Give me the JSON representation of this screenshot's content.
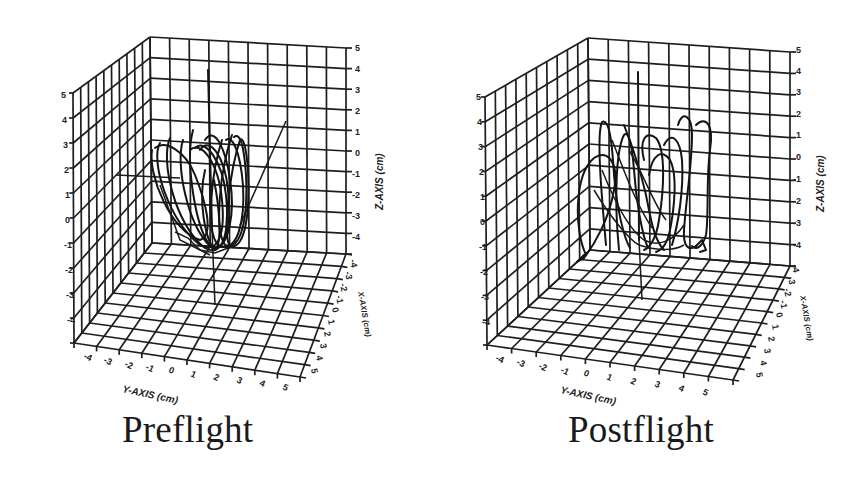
{
  "figure": {
    "panels": [
      {
        "id": "preflight",
        "caption": "Preflight"
      },
      {
        "id": "postflight",
        "caption": "Postflight"
      }
    ]
  },
  "chart_data": [
    {
      "type": "scatter",
      "subtype": "3d-line-trajectory",
      "title": "Preflight",
      "xlabel": "X-AXIS (cm)",
      "ylabel": "Y-AXIS (cm)",
      "zlabel": "Z-AXIS (cm)",
      "x_ticks": [
        "-4",
        "-3",
        "-2",
        "-1",
        "0",
        "1",
        "2",
        "3",
        "4",
        "5"
      ],
      "y_ticks": [
        "-4",
        "-3",
        "-2",
        "-1",
        "0",
        "1",
        "2",
        "3",
        "4",
        "5"
      ],
      "z_ticks": [
        "5",
        "4",
        "3",
        "2",
        "1",
        "0",
        "-1",
        "-2",
        "-3",
        "-4"
      ],
      "left_wall_ticks": [
        "5",
        "4",
        "3",
        "2",
        "1",
        "0",
        "-1",
        "-2",
        "-3",
        "-4"
      ],
      "xlim": [
        -4,
        5
      ],
      "ylim": [
        -4,
        5
      ],
      "zlim": [
        -5,
        5
      ],
      "grid": true,
      "description": "Tight, regular looping trajectory: repeated narrow vertical ellipses clustered between Y≈-1..2, Z≈-4..1"
    },
    {
      "type": "scatter",
      "subtype": "3d-line-trajectory",
      "title": "Postflight",
      "xlabel": "X-AXIS (cm)",
      "ylabel": "Y-AXIS (cm)",
      "zlabel": "Z-AXIS (cm)",
      "x_ticks": [
        "-4",
        "-3",
        "-2",
        "-1",
        "0",
        "1",
        "2",
        "3",
        "4",
        "5"
      ],
      "y_ticks": [
        "-4",
        "-3",
        "-2",
        "-1",
        "0",
        "1",
        "2",
        "3",
        "4",
        "5"
      ],
      "z_ticks": [
        "5",
        "4",
        "3",
        "2",
        "1",
        "0",
        "-1",
        "-2",
        "-3",
        "-4"
      ],
      "left_wall_ticks": [
        "5",
        "4",
        "3",
        "2",
        "1",
        "0",
        "-1",
        "-2",
        "-3",
        "-4"
      ],
      "xlim": [
        -4,
        5
      ],
      "ylim": [
        -4,
        5
      ],
      "zlim": [
        -5,
        5
      ],
      "grid": true,
      "description": "Irregular, wider-spread looping trajectory: loops span Y≈-3..3, Z≈-4..2, less regular than preflight"
    }
  ]
}
